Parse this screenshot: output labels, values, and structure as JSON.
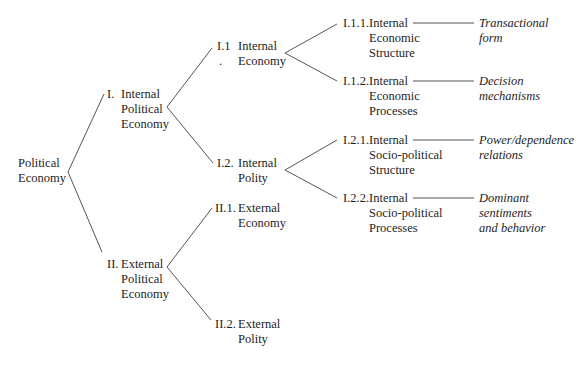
{
  "diagram": {
    "type": "tree",
    "root": {
      "lines": [
        "Political",
        "Economy"
      ]
    },
    "level1": [
      {
        "num": "I.",
        "lines": [
          "Internal",
          "Political",
          "Economy"
        ]
      },
      {
        "num": "II.",
        "lines": [
          "External",
          "Political",
          "Economy"
        ]
      }
    ],
    "level2": [
      {
        "num": "I.1",
        "num_extra": ".",
        "lines": [
          "Internal",
          "Economy"
        ]
      },
      {
        "num": "I.2.",
        "lines": [
          "Internal",
          "Polity"
        ]
      },
      {
        "num": "II.1.",
        "lines": [
          "External",
          "Economy"
        ]
      },
      {
        "num": "II.2.",
        "lines": [
          "External",
          "Polity"
        ]
      }
    ],
    "level3": [
      {
        "num": "I.1.1.",
        "lines": [
          "Internal",
          "Economic",
          "Structure"
        ],
        "note": [
          "Transactional",
          "form"
        ]
      },
      {
        "num": "I.1.2.",
        "lines": [
          "Internal",
          "Economic",
          "Processes"
        ],
        "note": [
          "Decision",
          "mechanisms"
        ]
      },
      {
        "num": "I.2.1.",
        "lines": [
          "Internal",
          "Socio-political",
          "Structure"
        ],
        "note": [
          "Power/dependence",
          "relations"
        ]
      },
      {
        "num": "I.2.2.",
        "lines": [
          "Internal",
          "Socio-political",
          "Processes"
        ],
        "note": [
          "Dominant",
          "sentiments",
          "and behavior"
        ]
      }
    ]
  },
  "colors": {
    "line": "#555555",
    "text": "#1e1e1e",
    "background": "#ffffff"
  }
}
